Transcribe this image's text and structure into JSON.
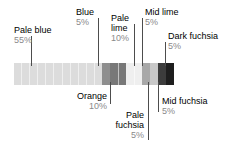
{
  "chart_data": {
    "type": "bar",
    "title": "",
    "subtitle": "",
    "xlabel": "",
    "ylabel": "",
    "orientation": "horizontal-stacked",
    "total_units": 20,
    "unit_percent": 5,
    "legend": "inline-callouts",
    "grid": false,
    "categories": [
      "Pale blue",
      "Blue",
      "Orange",
      "Pale lime",
      "Mid lime",
      "Pale fuchsia",
      "Mid fuchsia",
      "Dark fuchsia"
    ],
    "values": [
      55,
      5,
      10,
      10,
      5,
      5,
      5,
      5
    ],
    "value_labels": [
      "55%",
      "5%",
      "10%",
      "10%",
      "5%",
      "5%",
      "5%",
      "5%"
    ],
    "colors": [
      "#dcdcdc",
      "#8e8e8e",
      "#787878",
      "#efefef",
      "#a8a8a8",
      "#c8c8c8",
      "#3c3c3c",
      "#1e1e1e"
    ],
    "units_per_category": [
      11,
      1,
      2,
      2,
      1,
      1,
      1,
      1
    ],
    "ylim": [
      0,
      100
    ]
  },
  "callouts": {
    "pale_blue": {
      "name": "Pale blue",
      "pct": "55%"
    },
    "blue": {
      "name": "Blue",
      "pct": "5%"
    },
    "pale_lime_l1": {
      "name": "Pale",
      "name2": "lime",
      "pct": "10%"
    },
    "mid_lime": {
      "name": "Mid lime",
      "pct": "5%"
    },
    "dark_fuchsia": {
      "name": "Dark fuchsia",
      "pct": "5%"
    },
    "orange": {
      "name": "Orange",
      "pct": "10%"
    },
    "pale_fuchsia": {
      "name": "Pale",
      "name2": "fuchsia",
      "pct": "5%"
    },
    "mid_fuchsia": {
      "name": "Mid fuchsia",
      "pct": "5%"
    }
  },
  "style": {
    "background": "#ffffff",
    "text_color": "#000000",
    "percent_color": "#8a8a8a",
    "leader_color": "#4d4d4d"
  }
}
